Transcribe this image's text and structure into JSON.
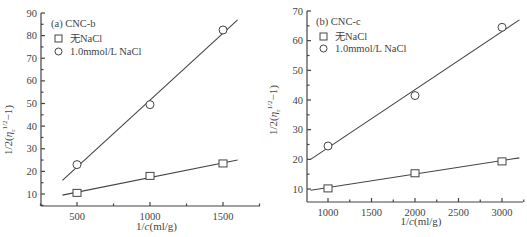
{
  "chart_data": [
    {
      "type": "scatter",
      "panel": "(a) CNC-b",
      "title": "(a) CNC-b",
      "xlabel": "1/c(ml/g)",
      "ylabel": "1/2(η_r^{1/2}−1)",
      "xticks": [
        500,
        1000,
        1500
      ],
      "yticks": [
        10,
        20,
        30,
        40,
        50,
        60,
        70,
        80,
        90
      ],
      "xlim": [
        250,
        1750
      ],
      "ylim": [
        4.7,
        90
      ],
      "legend": [
        "无NaCl",
        "1.0mmol/L NaCl"
      ],
      "legend_position": "upper left",
      "grid": false,
      "series": [
        {
          "name": "无NaCl",
          "marker": "square",
          "x": [
            500,
            1000,
            1500
          ],
          "y": [
            10.5,
            18,
            23.5
          ],
          "fit_line": {
            "x": [
              400,
              1600
            ],
            "y": [
              9.5,
              25
            ]
          }
        },
        {
          "name": "1.0mmol/L NaCl",
          "marker": "circle",
          "x": [
            500,
            1000,
            1500
          ],
          "y": [
            23,
            49.5,
            82.5
          ],
          "fit_line": {
            "x": [
              400,
              1600
            ],
            "y": [
              16,
              87
            ]
          }
        }
      ]
    },
    {
      "type": "scatter",
      "panel": "(b) CNC-c",
      "title": "(b) CNC-c",
      "xlabel": "1/c(ml/g)",
      "ylabel": "1/2(η_r^{1/2}−1)",
      "xticks": [
        1000,
        1500,
        2000,
        2500,
        3000
      ],
      "yticks": [
        10,
        20,
        30,
        40,
        50,
        60,
        70
      ],
      "xlim": [
        760,
        3250
      ],
      "ylim": [
        5.6,
        70
      ],
      "legend": [
        "无NaCl",
        "1.0mmol/L NaCl"
      ],
      "legend_position": "upper left",
      "grid": false,
      "series": [
        {
          "name": "无NaCl",
          "marker": "square",
          "x": [
            1000,
            2000,
            3000
          ],
          "y": [
            10.2,
            15.3,
            19.3
          ],
          "fit_line": {
            "x": [
              800,
              3200
            ],
            "y": [
              9.6,
              20.5
            ]
          }
        },
        {
          "name": "1.0mmol/L NaCl",
          "marker": "circle",
          "x": [
            1000,
            2000,
            3000
          ],
          "y": [
            24.5,
            41.5,
            64.5
          ],
          "fit_line": {
            "x": [
              800,
              3200
            ],
            "y": [
              20,
              67
            ]
          }
        }
      ]
    }
  ],
  "panels": [
    {
      "title": "(a) CNC-b",
      "xlabel": "1/c(ml/g)",
      "ylabel": "1/2(η",
      "legend": [
        {
          "label": "无NaCl"
        },
        {
          "label": "1.0mmol/L NaCl"
        }
      ],
      "xtick_labels": [
        "500",
        "1000",
        "1500"
      ],
      "ytick_labels": [
        "10",
        "20",
        "30",
        "40",
        "50",
        "60",
        "70",
        "80",
        "90"
      ]
    },
    {
      "title": "(b) CNC-c",
      "xlabel": "1/c(ml/g)",
      "ylabel": "1/2(η",
      "legend": [
        {
          "label": "无NaCl"
        },
        {
          "label": "1.0mmol/L NaCl"
        }
      ],
      "xtick_labels": [
        "1000",
        "1500",
        "2000",
        "2500",
        "3000"
      ],
      "ytick_labels": [
        "10",
        "20",
        "30",
        "40",
        "50",
        "60",
        "70"
      ]
    }
  ]
}
